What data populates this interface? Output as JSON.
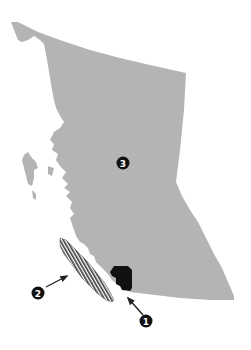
{
  "map": {
    "type": "regional-locator-map",
    "colors": {
      "background": "#ffffff",
      "main_region": "#b4b4b4",
      "highlight_region": "#111111",
      "hatched_region": "#3a3a3a",
      "marker_fill": "#111111",
      "marker_text": "#ffffff",
      "arrow": "#222222"
    },
    "markers": [
      {
        "id": "1",
        "label": "1",
        "points_to": "black-region"
      },
      {
        "id": "2",
        "label": "2",
        "points_to": "hatched-island"
      },
      {
        "id": "3",
        "label": "3",
        "points_to": "main-gray-region"
      }
    ]
  }
}
